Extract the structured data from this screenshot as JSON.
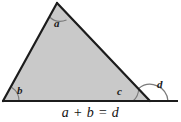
{
  "figure": {
    "name": "exterior-angle-triangle-figure",
    "caption": "a + b = d",
    "fill_color": "#c9c9c9",
    "stroke_color": "#1c1c1c",
    "arc_color": "#6e6e6e",
    "background_color": "#ffffff"
  },
  "labels": {
    "apex": "a",
    "bottom_left": "b",
    "bottom_right_interior": "c",
    "exterior": "d"
  },
  "geometry": {
    "apex": {
      "x": 57,
      "y": 3
    },
    "bottom_left": {
      "x": 3,
      "y": 101
    },
    "bottom_right": {
      "x": 150,
      "y": 101
    },
    "baseline_end": {
      "x": 178,
      "y": 101
    }
  },
  "equation": {
    "left_term_1": "a",
    "operator": "+",
    "left_term_2": "b",
    "equals": "=",
    "right_term": "d",
    "full": "a + b = d"
  }
}
